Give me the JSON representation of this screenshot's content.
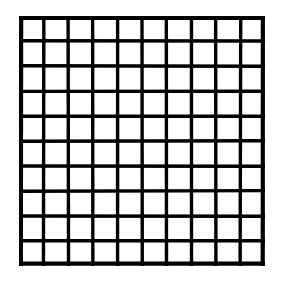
{
  "figure": {
    "title": "",
    "kind": "grid-diagram",
    "background_color": "#ffffff",
    "ink_color": "#000000"
  },
  "chart_data": {
    "type": "table",
    "title": "",
    "xlabel": "",
    "ylabel": "",
    "rows": 10,
    "columns": 10,
    "total_cells": 100,
    "horizontal_lines": 11,
    "vertical_lines": 11,
    "cell_fill": "none",
    "cell_labels": [
      [
        "",
        "",
        "",
        "",
        "",
        "",
        "",
        "",
        "",
        ""
      ],
      [
        "",
        "",
        "",
        "",
        "",
        "",
        "",
        "",
        "",
        ""
      ],
      [
        "",
        "",
        "",
        "",
        "",
        "",
        "",
        "",
        "",
        ""
      ],
      [
        "",
        "",
        "",
        "",
        "",
        "",
        "",
        "",
        "",
        ""
      ],
      [
        "",
        "",
        "",
        "",
        "",
        "",
        "",
        "",
        "",
        ""
      ],
      [
        "",
        "",
        "",
        "",
        "",
        "",
        "",
        "",
        "",
        ""
      ],
      [
        "",
        "",
        "",
        "",
        "",
        "",
        "",
        "",
        "",
        ""
      ],
      [
        "",
        "",
        "",
        "",
        "",
        "",
        "",
        "",
        "",
        ""
      ],
      [
        "",
        "",
        "",
        "",
        "",
        "",
        "",
        "",
        "",
        ""
      ],
      [
        "",
        "",
        "",
        "",
        "",
        "",
        "",
        "",
        "",
        ""
      ]
    ],
    "grid": true,
    "legend": [],
    "annotations": [],
    "geometry": {
      "left": 19,
      "top": 16,
      "width": 246,
      "height": 250,
      "cell_width": 24.6,
      "cell_height": 25.0,
      "line_width_inner": 3.4,
      "line_width_outer": 4.2
    }
  }
}
